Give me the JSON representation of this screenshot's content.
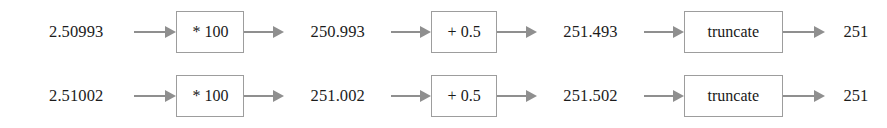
{
  "diagram": {
    "type": "flow-pipeline",
    "background_color": "#ffffff",
    "text_color": "#1c1c1c",
    "box_border_color": "#9d9d9d",
    "arrow_color": "#8f8f8f",
    "arrow_icon_name": "arrow-right-icon",
    "rows": [
      {
        "id": "row-0",
        "input": "2.50993",
        "op1": "* 100",
        "value1": "250.993",
        "op2": "+ 0.5",
        "value2": "251.493",
        "op3": "truncate",
        "output": "251"
      },
      {
        "id": "row-1",
        "input": "2.51002",
        "op1": "* 100",
        "value1": "251.002",
        "op2": "+ 0.5",
        "value2": "251.502",
        "op3": "truncate",
        "output": "251"
      }
    ]
  }
}
